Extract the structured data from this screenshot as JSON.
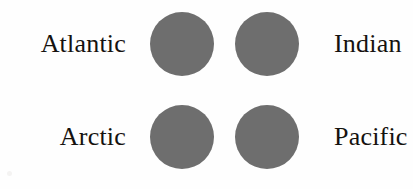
{
  "diagram": {
    "background_color": "#fefefe",
    "circle_color": "#6e6e6e",
    "text_color": "#15120f",
    "rows": [
      {
        "left_label": "Atlantic",
        "right_label": "Indian"
      },
      {
        "left_label": "Arctic",
        "right_label": "Pacific"
      }
    ],
    "circles": [
      {
        "name": "circle-atlantic",
        "diameter": "64"
      },
      {
        "name": "circle-indian",
        "diameter": "64"
      },
      {
        "name": "circle-arctic",
        "diameter": "64"
      },
      {
        "name": "circle-pacific",
        "diameter": "64"
      }
    ]
  }
}
